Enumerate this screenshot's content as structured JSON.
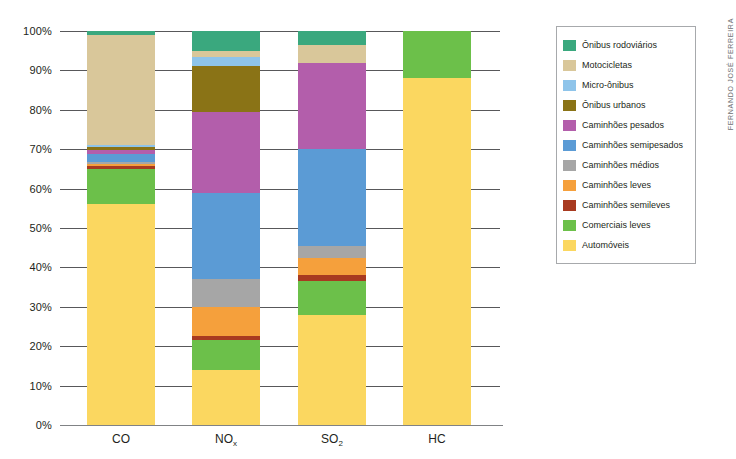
{
  "credit": "FERNANDO JOSÉ FERREIRA",
  "axis": {
    "yticks": [
      "100%",
      "90%",
      "80%",
      "70%",
      "60%",
      "50%",
      "40%",
      "30%",
      "20%",
      "10%",
      "0%"
    ],
    "ytick_values": [
      100,
      90,
      80,
      70,
      60,
      50,
      40,
      30,
      20,
      10,
      0
    ]
  },
  "legend": {
    "items": [
      {
        "label": "Ônibus rodoviários",
        "color": "#3aa87e"
      },
      {
        "label": "Motocicletas",
        "color": "#d9c79a"
      },
      {
        "label": "Micro-ônibus",
        "color": "#8ec4ea"
      },
      {
        "label": "Ônibus urbanos",
        "color": "#8a7316"
      },
      {
        "label": "Caminhões pesados",
        "color": "#b35eab"
      },
      {
        "label": "Caminhões semipesados",
        "color": "#5b9bd5"
      },
      {
        "label": "Caminhões médios",
        "color": "#a6a6a6"
      },
      {
        "label": "Caminhões leves",
        "color": "#f5a03c"
      },
      {
        "label": "Caminhões semileves",
        "color": "#a83a20"
      },
      {
        "label": "Comerciais leves",
        "color": "#6cc04a"
      },
      {
        "label": "Automóveis",
        "color": "#fbd760"
      }
    ]
  },
  "chart_data": {
    "type": "bar",
    "stacked": true,
    "normalized_percent": true,
    "title": "",
    "xlabel": "",
    "ylabel": "",
    "ylim": [
      0,
      100
    ],
    "grid": true,
    "legend_position": "right",
    "categories": [
      "CO",
      "NOx",
      "SO2",
      "HC"
    ],
    "category_labels_html": [
      "CO",
      "NO<sub>x</sub>",
      "SO<sub>2</sub>",
      "HC"
    ],
    "series": [
      {
        "name": "Automóveis",
        "color": "#fbd760",
        "values": [
          56.0,
          14.0,
          28.0,
          88.0
        ]
      },
      {
        "name": "Comerciais leves",
        "color": "#6cc04a",
        "values": [
          9.0,
          7.5,
          8.5,
          12.0
        ]
      },
      {
        "name": "Caminhões semileves",
        "color": "#a83a20",
        "values": [
          0.7,
          1.0,
          1.5,
          0.0
        ]
      },
      {
        "name": "Caminhões leves",
        "color": "#f5a03c",
        "values": [
          0.6,
          7.5,
          4.5,
          0.0
        ]
      },
      {
        "name": "Caminhões médios",
        "color": "#a6a6a6",
        "values": [
          0.5,
          7.0,
          3.0,
          0.0
        ]
      },
      {
        "name": "Caminhões semipesados",
        "color": "#5b9bd5",
        "values": [
          2.0,
          22.0,
          24.5,
          0.0
        ]
      },
      {
        "name": "Caminhões pesados",
        "color": "#b35eab",
        "values": [
          1.0,
          20.5,
          22.0,
          0.0
        ]
      },
      {
        "name": "Ônibus urbanos",
        "color": "#8a7316",
        "values": [
          0.7,
          11.5,
          0.0,
          0.0
        ]
      },
      {
        "name": "Micro-ônibus",
        "color": "#8ec4ea",
        "values": [
          0.5,
          2.5,
          0.0,
          0.0
        ]
      },
      {
        "name": "Motocicletas",
        "color": "#d9c79a",
        "values": [
          28.0,
          1.5,
          4.5,
          0.0
        ]
      },
      {
        "name": "Ônibus rodoviários",
        "color": "#3aa87e",
        "values": [
          1.0,
          5.0,
          3.5,
          0.0
        ]
      }
    ]
  }
}
